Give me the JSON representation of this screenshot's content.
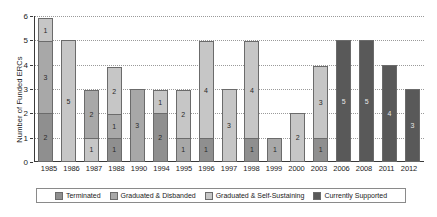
{
  "chart_data": {
    "type": "bar",
    "title": "",
    "subtitle": "",
    "xlabel": "",
    "ylabel": "Number of Funded ERCs",
    "ylim": [
      0,
      6
    ],
    "yticks": [
      0,
      1,
      2,
      3,
      4,
      5,
      6
    ],
    "grid": true,
    "stacked": true,
    "legend_position": "bottom",
    "categories": [
      "1985",
      "1986",
      "1987",
      "1988",
      "1990",
      "1994",
      "1995",
      "1996",
      "1997",
      "1998",
      "1999",
      "2000",
      "2003",
      "2006",
      "2008",
      "2011",
      "2012"
    ],
    "series": [
      {
        "name": "Terminated",
        "color": "#8f8f8f",
        "values": [
          2,
          0,
          0,
          1,
          0,
          2,
          0,
          1,
          0,
          1,
          0,
          0,
          1,
          0,
          0,
          0,
          0
        ]
      },
      {
        "name": "Graduated & Disbanded",
        "color": "#a8a8a8",
        "values": [
          3,
          0,
          2,
          1,
          3,
          0,
          1,
          0,
          0,
          0,
          1,
          0,
          0,
          0,
          0,
          0,
          0
        ]
      },
      {
        "name": "Graduated & Self-Sustaining",
        "color": "#c6c6c6",
        "values": [
          1,
          5,
          1,
          2,
          0,
          1,
          2,
          4,
          3,
          4,
          0,
          2,
          3,
          0,
          0,
          0,
          0
        ]
      },
      {
        "name": "Currently Supported",
        "color": "#595959",
        "values": [
          0,
          0,
          0,
          0,
          0,
          0,
          0,
          0,
          0,
          0,
          0,
          0,
          0,
          5,
          5,
          4,
          3
        ]
      }
    ],
    "totals": [
      6,
      5,
      3,
      4,
      3,
      3,
      3,
      5,
      3,
      5,
      1,
      2,
      4,
      5,
      5,
      4,
      3
    ],
    "bar_segments": [
      {
        "category": "1985",
        "segments": [
          {
            "series": "Terminated",
            "value": 2
          },
          {
            "series": "Graduated & Disbanded",
            "value": 3
          },
          {
            "series": "Graduated & Self-Sustaining",
            "value": 1
          }
        ]
      },
      {
        "category": "1986",
        "segments": [
          {
            "series": "Graduated & Self-Sustaining",
            "value": 5
          }
        ]
      },
      {
        "category": "1987",
        "segments": [
          {
            "series": "Graduated & Self-Sustaining",
            "value": 1
          },
          {
            "series": "Graduated & Disbanded",
            "value": 2
          }
        ]
      },
      {
        "category": "1988",
        "segments": [
          {
            "series": "Terminated",
            "value": 1
          },
          {
            "series": "Graduated & Disbanded",
            "value": 1
          },
          {
            "series": "Graduated & Self-Sustaining",
            "value": 2
          }
        ]
      },
      {
        "category": "1990",
        "segments": [
          {
            "series": "Graduated & Disbanded",
            "value": 3
          }
        ]
      },
      {
        "category": "1994",
        "segments": [
          {
            "series": "Terminated",
            "value": 2
          },
          {
            "series": "Graduated & Self-Sustaining",
            "value": 1
          }
        ]
      },
      {
        "category": "1995",
        "segments": [
          {
            "series": "Graduated & Disbanded",
            "value": 1
          },
          {
            "series": "Graduated & Self-Sustaining",
            "value": 2
          }
        ]
      },
      {
        "category": "1996",
        "segments": [
          {
            "series": "Terminated",
            "value": 1
          },
          {
            "series": "Graduated & Self-Sustaining",
            "value": 4
          }
        ]
      },
      {
        "category": "1997",
        "segments": [
          {
            "series": "Graduated & Self-Sustaining",
            "value": 3
          }
        ]
      },
      {
        "category": "1998",
        "segments": [
          {
            "series": "Terminated",
            "value": 1
          },
          {
            "series": "Graduated & Self-Sustaining",
            "value": 4
          }
        ]
      },
      {
        "category": "1999",
        "segments": [
          {
            "series": "Graduated & Disbanded",
            "value": 1
          }
        ]
      },
      {
        "category": "2000",
        "segments": [
          {
            "series": "Graduated & Self-Sustaining",
            "value": 2
          }
        ]
      },
      {
        "category": "2003",
        "segments": [
          {
            "series": "Terminated",
            "value": 1
          },
          {
            "series": "Graduated & Self-Sustaining",
            "value": 3
          }
        ]
      },
      {
        "category": "2006",
        "segments": [
          {
            "series": "Currently Supported",
            "value": 5
          }
        ]
      },
      {
        "category": "2008",
        "segments": [
          {
            "series": "Currently Supported",
            "value": 5
          }
        ]
      },
      {
        "category": "2011",
        "segments": [
          {
            "series": "Currently Supported",
            "value": 4
          }
        ]
      },
      {
        "category": "2012",
        "segments": [
          {
            "series": "Currently Supported",
            "value": 3
          }
        ]
      }
    ]
  },
  "legend": {
    "items": [
      {
        "label": "Terminated",
        "color": "#8f8f8f"
      },
      {
        "label": "Graduated & Disbanded",
        "color": "#a8a8a8"
      },
      {
        "label": "Graduated & Self-Sustaining",
        "color": "#c6c6c6"
      },
      {
        "label": "Currently Supported",
        "color": "#595959"
      }
    ]
  },
  "axis": {
    "y_title": "Number of Funded ERCs",
    "y_tick_labels": [
      "0",
      "1",
      "2",
      "3",
      "4",
      "5",
      "6"
    ]
  },
  "colors": {
    "terminated": "#8f8f8f",
    "graduated_disbanded": "#a8a8a8",
    "graduated_self_sustaining": "#c6c6c6",
    "currently_supported": "#595959",
    "grid": "#9a9a9a",
    "axis": "#3a3a3a",
    "background": "#ffffff"
  }
}
